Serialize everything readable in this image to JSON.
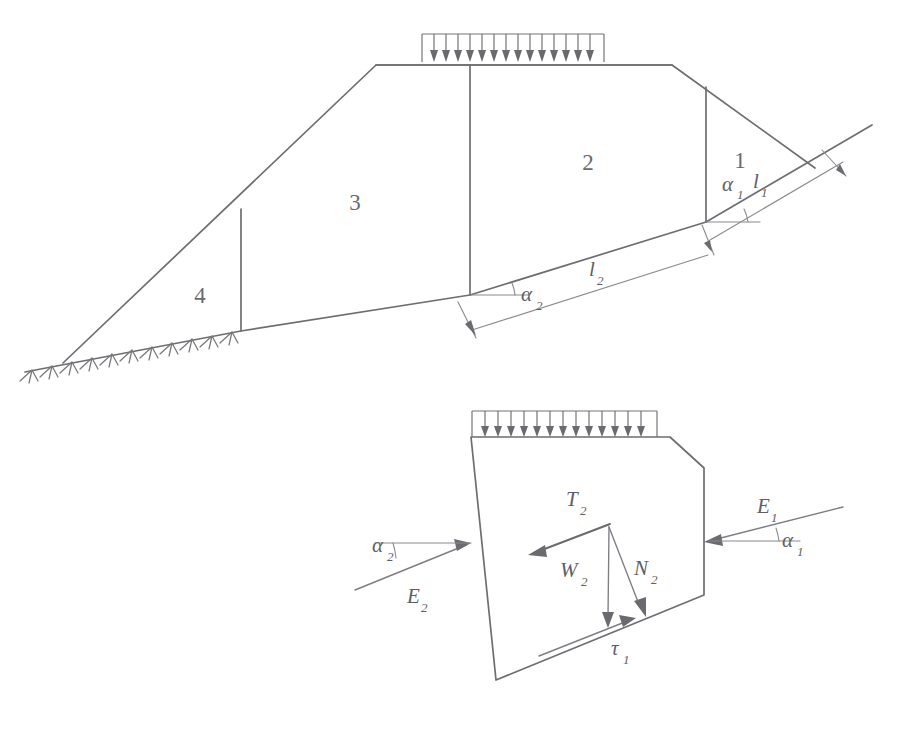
{
  "figure": {
    "stroke_color": "#6e6e72",
    "background_color": "#ffffff"
  },
  "upper_diagram": {
    "name": "embankment-wedge-section",
    "wedge_labels": [
      {
        "id": "wedge-1",
        "text": "1",
        "x": 740,
        "y": 163
      },
      {
        "id": "wedge-2",
        "text": "2",
        "x": 588,
        "y": 165
      },
      {
        "id": "wedge-3",
        "text": "3",
        "x": 355,
        "y": 205
      },
      {
        "id": "wedge-4",
        "text": "4",
        "x": 200,
        "y": 298
      }
    ],
    "annotations": [
      {
        "id": "alpha-1",
        "symbol": "α",
        "subscript": "1",
        "x": 722,
        "y": 186
      },
      {
        "id": "length-l1",
        "symbol": "l",
        "subscript": "1",
        "x": 753,
        "y": 183
      },
      {
        "id": "alpha-2",
        "symbol": "α",
        "subscript": "2",
        "x": 521,
        "y": 296
      },
      {
        "id": "length-l2",
        "symbol": "l",
        "subscript": "2",
        "x": 589,
        "y": 271
      }
    ],
    "distributed_load": {
      "id": "surcharge-load-upper",
      "arrow_count": 16,
      "x_start": 422,
      "x_end": 604,
      "y_top": 34,
      "y_bottom": 62
    }
  },
  "lower_diagram": {
    "name": "free-body-diagram-wedge-2",
    "distributed_load": {
      "id": "surcharge-load-lower",
      "arrow_count": 15,
      "x_start": 472,
      "x_end": 657,
      "y_top": 411,
      "y_bottom": 437
    },
    "force_labels": [
      {
        "id": "force-T2",
        "symbol": "T",
        "subscript": "2",
        "x": 566,
        "y": 501
      },
      {
        "id": "force-W2",
        "symbol": "W",
        "subscript": "2",
        "x": 560,
        "y": 572
      },
      {
        "id": "force-N2",
        "symbol": "N",
        "subscript": "2",
        "x": 634,
        "y": 570
      },
      {
        "id": "force-E1",
        "symbol": "E",
        "subscript": "1",
        "x": 757,
        "y": 508
      },
      {
        "id": "force-E2",
        "symbol": "E",
        "subscript": "2",
        "x": 407,
        "y": 598
      },
      {
        "id": "force-tau1",
        "symbol": "τ",
        "subscript": "1",
        "x": 611,
        "y": 650
      }
    ],
    "angle_labels": [
      {
        "id": "angle-alpha1-fbd",
        "symbol": "α",
        "subscript": "1",
        "x": 782,
        "y": 542
      },
      {
        "id": "angle-alpha2-fbd",
        "symbol": "α",
        "subscript": "2",
        "x": 372,
        "y": 547
      }
    ]
  }
}
